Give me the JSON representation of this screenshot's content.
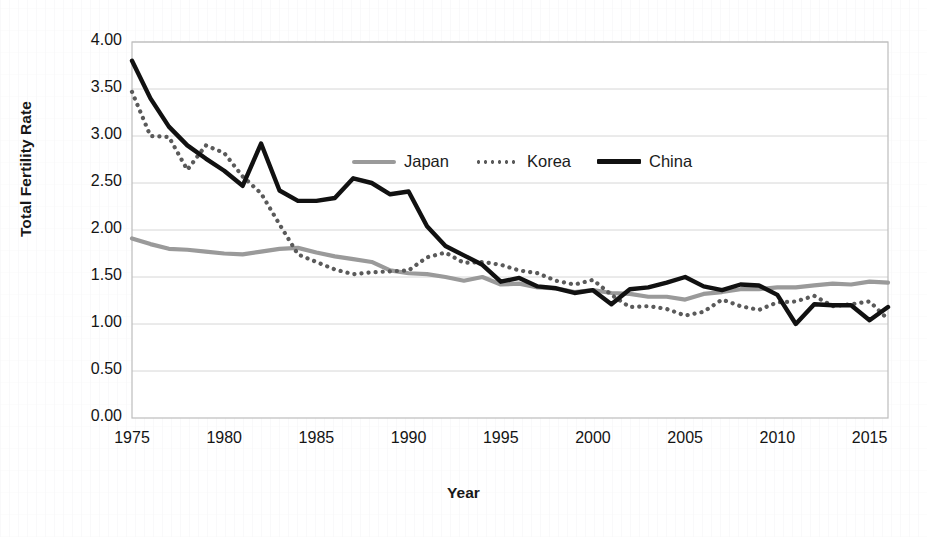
{
  "chart_data": {
    "type": "line",
    "title": "",
    "xlabel": "Year",
    "ylabel": "Total Fertility Rate",
    "xlim": [
      1975,
      2016
    ],
    "ylim": [
      0.0,
      4.0
    ],
    "grid": true,
    "legend_position": "upper-center",
    "x_tick_labels": [
      "1975",
      "1980",
      "1985",
      "1990",
      "1995",
      "2000",
      "2005",
      "2010",
      "2015"
    ],
    "x_tick_values": [
      1975,
      1980,
      1985,
      1990,
      1995,
      2000,
      2005,
      2010,
      2015
    ],
    "y_tick_labels": [
      "0.00",
      "0.50",
      "1.00",
      "1.50",
      "2.00",
      "2.50",
      "3.00",
      "3.50",
      "4.00"
    ],
    "y_tick_values": [
      0.0,
      0.5,
      1.0,
      1.5,
      2.0,
      2.5,
      3.0,
      3.5,
      4.0
    ],
    "x": [
      1975,
      1976,
      1977,
      1978,
      1979,
      1980,
      1981,
      1982,
      1983,
      1984,
      1985,
      1986,
      1987,
      1988,
      1989,
      1990,
      1991,
      1992,
      1993,
      1994,
      1995,
      1996,
      1997,
      1998,
      1999,
      2000,
      2001,
      2002,
      2003,
      2004,
      2005,
      2006,
      2007,
      2008,
      2009,
      2010,
      2011,
      2012,
      2013,
      2014,
      2015,
      2016
    ],
    "series": [
      {
        "name": "Japan",
        "style": "solid",
        "color": "#9a9a9a",
        "values": [
          1.91,
          1.85,
          1.8,
          1.79,
          1.77,
          1.75,
          1.74,
          1.77,
          1.8,
          1.81,
          1.76,
          1.72,
          1.69,
          1.66,
          1.57,
          1.54,
          1.53,
          1.5,
          1.46,
          1.5,
          1.42,
          1.43,
          1.39,
          1.38,
          1.34,
          1.36,
          1.33,
          1.32,
          1.29,
          1.29,
          1.26,
          1.32,
          1.34,
          1.37,
          1.37,
          1.39,
          1.39,
          1.41,
          1.43,
          1.42,
          1.45,
          1.44
        ]
      },
      {
        "name": "Korea",
        "style": "dotted",
        "color": "#5a5a5a",
        "values": [
          3.47,
          3.0,
          2.99,
          2.64,
          2.9,
          2.82,
          2.57,
          2.39,
          2.06,
          1.74,
          1.66,
          1.58,
          1.53,
          1.55,
          1.56,
          1.57,
          1.71,
          1.76,
          1.65,
          1.66,
          1.63,
          1.57,
          1.54,
          1.46,
          1.42,
          1.47,
          1.31,
          1.18,
          1.19,
          1.16,
          1.09,
          1.13,
          1.26,
          1.19,
          1.15,
          1.23,
          1.24,
          1.3,
          1.19,
          1.21,
          1.24,
          1.05
        ]
      },
      {
        "name": "China",
        "style": "solid",
        "color": "#111111",
        "values": [
          3.8,
          3.4,
          3.1,
          2.9,
          2.76,
          2.63,
          2.47,
          2.92,
          2.42,
          2.31,
          2.31,
          2.34,
          2.55,
          2.5,
          2.38,
          2.41,
          2.04,
          1.83,
          1.73,
          1.63,
          1.45,
          1.49,
          1.4,
          1.38,
          1.33,
          1.36,
          1.21,
          1.37,
          1.39,
          1.44,
          1.5,
          1.4,
          1.36,
          1.42,
          1.41,
          1.31,
          1.0,
          1.21,
          1.2,
          1.2,
          1.04,
          1.18
        ]
      }
    ]
  },
  "axes": {
    "y_title": "Total Fertility Rate",
    "x_title": "Year"
  },
  "legend": {
    "items": [
      {
        "label": "Japan",
        "swatch": "solid-gray-line-icon"
      },
      {
        "label": "Korea",
        "swatch": "dotted-gray-line-icon"
      },
      {
        "label": "China",
        "swatch": "solid-black-line-icon"
      }
    ]
  },
  "background_artifacts": {
    "top_a": "",
    "top_b": "",
    "top_c": "",
    "bottom_a": "",
    "bottom_b": ""
  }
}
